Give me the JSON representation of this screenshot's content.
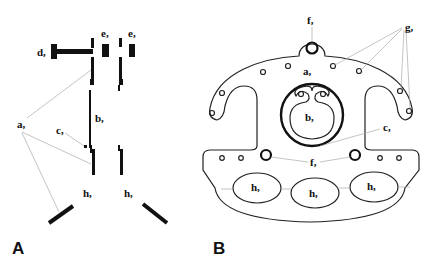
{
  "panels": {
    "a": {
      "letter": "A",
      "labels": {
        "a": "a,",
        "b": "b,",
        "c": "c,",
        "d": "d,",
        "e1": "e,",
        "e2": "e,",
        "h1": "h,",
        "h2": "h,"
      }
    },
    "b": {
      "letter": "B",
      "labels": {
        "f_top": "f,",
        "f_mid": "f,",
        "g": "g,",
        "a": "a,",
        "b": "b,",
        "c": "c,",
        "h1": "h,",
        "h2": "h,",
        "h3": "h,"
      }
    }
  },
  "colors": {
    "ink": "#111111",
    "leader": "#aaaaaa",
    "background": "#ffffff"
  }
}
